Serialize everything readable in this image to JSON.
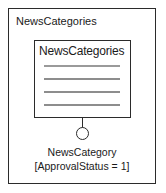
{
  "diagram": {
    "type": "data-source-binding-diagram",
    "frame": {
      "label": "NewsCategories"
    },
    "inner_box": {
      "title": "NewsCategories",
      "rows": [
        {
          "id": "row-1"
        },
        {
          "id": "row-2"
        },
        {
          "id": "row-3"
        },
        {
          "id": "row-4"
        }
      ]
    },
    "connector": {
      "stem_icon": "vertical-line-icon",
      "port_icon": "circle-port-icon"
    },
    "captions": [
      "NewsCategory",
      "[ApprovalStatus = 1]"
    ],
    "colors": {
      "border": "#2b2b2b",
      "row_line": "#8d8d8d",
      "text": "#1a1a1a",
      "background": "#ffffff"
    }
  }
}
